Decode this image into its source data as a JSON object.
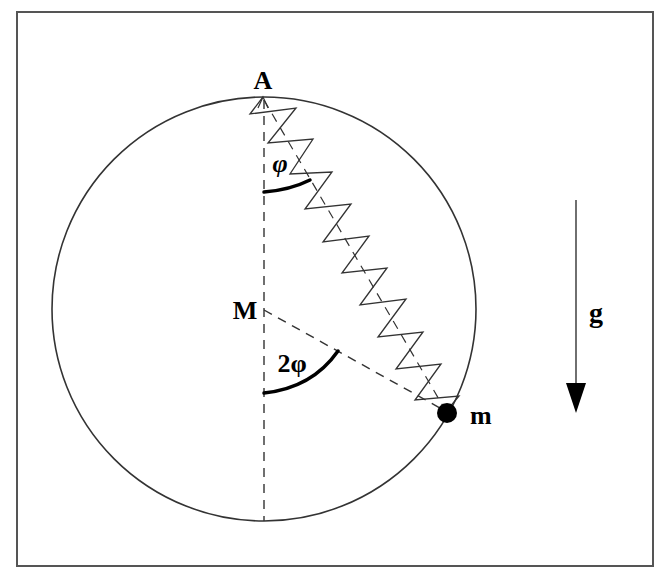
{
  "diagram": {
    "type": "physics-mechanics",
    "labels": {
      "top_point": "A",
      "center": "M",
      "mass": "m",
      "gravity": "g",
      "angle_at_A": "φ",
      "angle_at_M": "2φ"
    },
    "elements": {
      "frame": {
        "x": 17,
        "y": 12,
        "width": 636,
        "height": 554,
        "stroke": "#555555"
      },
      "ring": {
        "cx": 264,
        "cy": 309,
        "r": 212,
        "stroke": "#333333"
      },
      "vertical_axis": {
        "from": "A",
        "to": "bottom-of-ring",
        "style": "dashed"
      },
      "radius_line": {
        "from": "M",
        "to": "m",
        "style": "dashed"
      },
      "spring": {
        "from": "A",
        "to": "m",
        "coils": 10,
        "style": "zigzag"
      },
      "mass_point": {
        "cx": 447,
        "cy": 413,
        "r": 10,
        "fill": "#000000"
      },
      "gravity_arrow": {
        "x": 575,
        "y1": 200,
        "y2": 412,
        "direction": "down"
      }
    },
    "colors": {
      "line": "#333333",
      "frame": "#555555",
      "text": "#000000",
      "background": "#ffffff"
    }
  }
}
